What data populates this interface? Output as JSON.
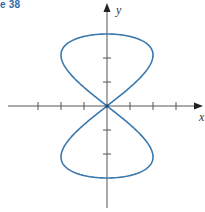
{
  "figure": {
    "label": "e 38"
  },
  "axes": {
    "x_label": "x",
    "y_label": "y",
    "origin_px": [
      107,
      106
    ],
    "x_unit_px": 23,
    "y_unit_px": 24,
    "x_ticks": [
      -3,
      -2,
      -1,
      1,
      2,
      3
    ],
    "y_ticks": [
      -2,
      -1,
      1,
      2
    ],
    "axis_color": "#555555"
  },
  "curve": {
    "description": "Vertical figure-eight parametric curve",
    "x_expr": "2 sin(2t)",
    "y_expr": "3 cos(t)",
    "t_range": [
      0,
      6.2832
    ],
    "color": "#3a78ad"
  },
  "chart_data": {
    "type": "line",
    "title": "",
    "xlabel": "x",
    "ylabel": "y",
    "xlim": [
      -4.3,
      4.2
    ],
    "ylim": [
      -4.2,
      4.2
    ],
    "grid": false,
    "series": [
      {
        "name": "figure-eight curve",
        "x": [
          0,
          1.41,
          2,
          1.41,
          0,
          -1.41,
          -2,
          -1.41,
          0,
          1.41,
          2,
          1.41,
          0,
          -1.41,
          -2,
          -1.41,
          0
        ],
        "y": [
          3,
          2.77,
          2.12,
          1.15,
          0,
          -1.15,
          -2.12,
          -2.77,
          -3,
          -2.77,
          -2.12,
          -1.15,
          0,
          1.15,
          2.12,
          2.77,
          3
        ]
      }
    ]
  }
}
